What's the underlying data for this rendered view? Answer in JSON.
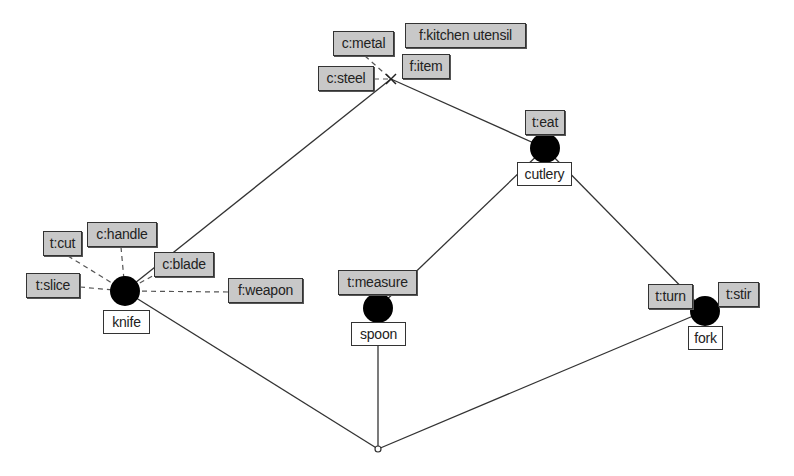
{
  "diagram": {
    "type": "concept lattice",
    "top_node": {
      "x": 391,
      "y": 79,
      "marker": "x"
    },
    "bottom_node": {
      "x": 378,
      "y": 449
    },
    "nodes": [
      {
        "id": "cutlery",
        "x": 545,
        "y": 148,
        "object": "cutlery",
        "attributes": [
          "t:eat"
        ]
      },
      {
        "id": "knife",
        "x": 125,
        "y": 291,
        "object": "knife",
        "attributes": [
          "t:cut",
          "c:handle",
          "t:slice",
          "c:blade",
          "f:weapon"
        ]
      },
      {
        "id": "spoon",
        "x": 378,
        "y": 308,
        "object": "spoon",
        "attributes": [
          "t:measure"
        ]
      },
      {
        "id": "fork",
        "x": 705,
        "y": 311,
        "object": "fork",
        "attributes": [
          "t:turn",
          "t:stir"
        ]
      }
    ],
    "top_attributes": [
      "c:metal",
      "f:kitchen utensil",
      "c:steel",
      "f:item"
    ],
    "edges": [
      [
        "top",
        "knife"
      ],
      [
        "top",
        "cutlery"
      ],
      [
        "cutlery",
        "spoon"
      ],
      [
        "cutlery",
        "fork"
      ],
      [
        "knife",
        "bottom"
      ],
      [
        "spoon",
        "bottom"
      ],
      [
        "fork",
        "bottom"
      ]
    ]
  },
  "labels": {
    "c_metal": "c:metal",
    "f_kitchen_utensil": "f:kitchen utensil",
    "c_steel": "c:steel",
    "f_item": "f:item",
    "t_eat": "t:eat",
    "cutlery": "cutlery",
    "t_cut": "t:cut",
    "c_handle": "c:handle",
    "c_blade": "c:blade",
    "t_slice": "t:slice",
    "f_weapon": "f:weapon",
    "knife": "knife",
    "t_measure": "t:measure",
    "spoon": "spoon",
    "t_turn": "t:turn",
    "t_stir": "t:stir",
    "fork": "fork"
  },
  "colors": {
    "attribute_label_bg": "#c8c8c8",
    "object_label_bg": "#ffffff",
    "node_fill": "#000000",
    "edge": "#333333"
  }
}
